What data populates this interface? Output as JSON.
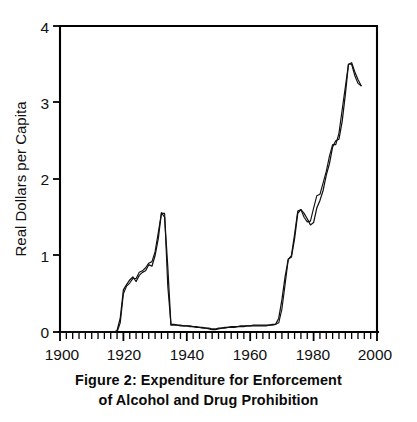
{
  "figure": {
    "caption_line1": "Figure 2: Expenditure for Enforcement",
    "caption_line2": "of Alcohol and Drug Prohibition"
  },
  "chart_data": {
    "type": "line",
    "title": "Figure 2: Expenditure for Enforcement of Alcohol and Drug Prohibition",
    "xlabel": "",
    "ylabel": "Real Dollars per Capita",
    "xlim": [
      1900,
      2000
    ],
    "ylim": [
      0,
      4
    ],
    "x_major_ticks": [
      1900,
      1920,
      1940,
      1960,
      1980,
      2000
    ],
    "x_tick_labels": [
      "1900",
      "1920",
      "1940",
      "1960",
      "1980",
      "2000"
    ],
    "x_minor_tick_step": 2,
    "y_major_ticks": [
      0,
      1,
      2,
      3,
      4
    ],
    "y_tick_labels": [
      "0",
      "1",
      "2",
      "3",
      "4"
    ],
    "grid": false,
    "legend": false,
    "legend_position": "none",
    "series": [
      {
        "name": "Enforcement expenditure (series A)",
        "x": [
          1900,
          1905,
          1910,
          1915,
          1917,
          1918,
          1919,
          1920,
          1921,
          1922,
          1923,
          1924,
          1925,
          1926,
          1927,
          1928,
          1929,
          1930,
          1931,
          1932,
          1933,
          1934,
          1935,
          1936,
          1937,
          1938,
          1939,
          1940,
          1941,
          1942,
          1943,
          1944,
          1945,
          1946,
          1947,
          1948,
          1949,
          1950,
          1951,
          1952,
          1953,
          1954,
          1955,
          1956,
          1957,
          1958,
          1959,
          1960,
          1961,
          1962,
          1963,
          1964,
          1965,
          1966,
          1967,
          1968,
          1969,
          1970,
          1971,
          1972,
          1973,
          1974,
          1975,
          1976,
          1977,
          1978,
          1979,
          1980,
          1981,
          1982,
          1983,
          1984,
          1985,
          1986,
          1987,
          1988,
          1989,
          1990,
          1991,
          1992,
          1993,
          1994,
          1995
        ],
        "y": [
          0.0,
          0.0,
          0.0,
          0.0,
          0.0,
          0.02,
          0.18,
          0.55,
          0.62,
          0.68,
          0.72,
          0.66,
          0.74,
          0.78,
          0.8,
          0.88,
          0.86,
          1.0,
          1.22,
          1.56,
          1.5,
          0.85,
          0.09,
          0.09,
          0.09,
          0.08,
          0.08,
          0.08,
          0.07,
          0.07,
          0.06,
          0.06,
          0.05,
          0.05,
          0.04,
          0.03,
          0.03,
          0.04,
          0.05,
          0.05,
          0.06,
          0.06,
          0.06,
          0.07,
          0.07,
          0.07,
          0.08,
          0.08,
          0.08,
          0.08,
          0.08,
          0.08,
          0.08,
          0.09,
          0.09,
          0.1,
          0.18,
          0.42,
          0.72,
          0.95,
          0.98,
          1.22,
          1.55,
          1.6,
          1.55,
          1.48,
          1.4,
          1.43,
          1.62,
          1.72,
          1.85,
          2.05,
          2.2,
          2.42,
          2.5,
          2.52,
          2.75,
          3.1,
          3.5,
          3.52,
          3.4,
          3.3,
          3.22
        ],
        "color": "#111111"
      },
      {
        "name": "Enforcement expenditure (series B)",
        "x": [
          1900,
          1905,
          1910,
          1915,
          1917,
          1918,
          1919,
          1920,
          1921,
          1922,
          1923,
          1924,
          1925,
          1926,
          1927,
          1928,
          1929,
          1930,
          1931,
          1932,
          1933,
          1934,
          1935,
          1936,
          1937,
          1938,
          1939,
          1940,
          1941,
          1942,
          1943,
          1944,
          1945,
          1946,
          1947,
          1948,
          1949,
          1950,
          1951,
          1952,
          1953,
          1954,
          1955,
          1956,
          1957,
          1958,
          1959,
          1960,
          1961,
          1962,
          1963,
          1964,
          1965,
          1966,
          1967,
          1968,
          1969,
          1970,
          1971,
          1972,
          1973,
          1974,
          1975,
          1976,
          1977,
          1978,
          1979,
          1980,
          1981,
          1982,
          1983,
          1984,
          1985,
          1986,
          1987,
          1988,
          1989,
          1990,
          1991,
          1992,
          1993,
          1994,
          1995
        ],
        "y": [
          0.0,
          0.0,
          0.0,
          0.0,
          0.0,
          0.0,
          0.12,
          0.5,
          0.6,
          0.64,
          0.7,
          0.7,
          0.78,
          0.8,
          0.84,
          0.9,
          0.92,
          1.05,
          1.3,
          1.55,
          1.55,
          0.6,
          0.1,
          0.1,
          0.09,
          0.09,
          0.08,
          0.08,
          0.08,
          0.07,
          0.07,
          0.06,
          0.06,
          0.05,
          0.05,
          0.04,
          0.04,
          0.05,
          0.05,
          0.06,
          0.06,
          0.07,
          0.07,
          0.07,
          0.08,
          0.08,
          0.08,
          0.08,
          0.09,
          0.09,
          0.09,
          0.09,
          0.09,
          0.09,
          0.1,
          0.1,
          0.12,
          0.3,
          0.62,
          0.95,
          1.0,
          1.28,
          1.58,
          1.6,
          1.5,
          1.44,
          1.45,
          1.62,
          1.78,
          1.8,
          1.95,
          2.1,
          2.3,
          2.45,
          2.45,
          2.6,
          2.9,
          3.2,
          3.5,
          3.5,
          3.35,
          3.25,
          3.22
        ],
        "color": "#111111"
      }
    ],
    "annotations": [
      {
        "text": "Alcohol Prohibition peak",
        "x": 1932,
        "y": 1.56
      },
      {
        "text": "Drug Prohibition peak",
        "x": 1991,
        "y": 3.52
      }
    ]
  },
  "axes": {
    "y_axis_title": "Real Dollars per Capita",
    "y_labels": [
      "4",
      "3",
      "2",
      "1",
      "0"
    ],
    "x_labels": [
      "1900",
      "1920",
      "1940",
      "1960",
      "1980",
      "2000"
    ]
  }
}
